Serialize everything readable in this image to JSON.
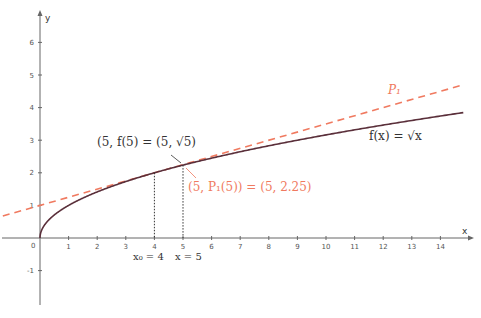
{
  "chart_data": {
    "type": "line",
    "title": "",
    "xlabel": "x",
    "ylabel": "y",
    "xlim": [
      -1.4,
      15.2
    ],
    "ylim": [
      -2.0,
      7.2
    ],
    "x_ticks": [
      "1",
      "2",
      "3",
      "4",
      "5",
      "6",
      "7",
      "8",
      "9",
      "10",
      "11",
      "12",
      "13",
      "14"
    ],
    "y_ticks": [
      "-1",
      "1",
      "2",
      "3",
      "4",
      "5",
      "6"
    ],
    "origin_label": "0",
    "grid": false,
    "series": [
      {
        "name": "f(x) = √x",
        "style": "solid",
        "color": "#5a2f3a",
        "formula": "sqrt(x)",
        "x_range": [
          0,
          14.8
        ]
      },
      {
        "name": "P₁",
        "style": "dashed",
        "color": "#f07a60",
        "formula": "1 + x/4",
        "x_range": [
          -1.3,
          14.8
        ]
      }
    ],
    "points": [
      {
        "x": 4,
        "y": 2,
        "label": "x₀ = 4"
      },
      {
        "x": 5,
        "y": 2.236,
        "label": "x = 5"
      }
    ],
    "annotations": [
      {
        "text": "(5, f(5) = (5, √5)",
        "color": "#333333"
      },
      {
        "text": "(5, P₁(5)) = (5, 2.25)",
        "color": "#f07a60"
      },
      {
        "text": "f(x) = √x",
        "color": "#333333"
      },
      {
        "text": "P₁",
        "color": "#f07a60"
      }
    ]
  },
  "labels": {
    "x_axis": "x",
    "y_axis": "y",
    "origin": "0",
    "x0": "x₀ = 4",
    "x5": "x = 5",
    "f_point": "(5, f(5) = (5, √5)",
    "p_point": "(5, P₁(5)) = (5, 2.25)",
    "f_label": "f(x) = √x",
    "p_label": "P₁"
  },
  "colors": {
    "curve": "#5a2f3a",
    "tangent": "#f07a60",
    "axis": "#555555"
  }
}
